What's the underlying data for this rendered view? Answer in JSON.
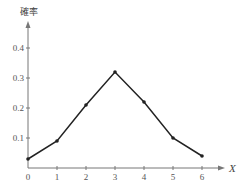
{
  "chart_data": {
    "type": "line",
    "title": "",
    "xlabel": "X",
    "ylabel": "確率",
    "x": [
      0,
      1,
      2,
      3,
      4,
      5,
      6
    ],
    "values": [
      0.03,
      0.09,
      0.21,
      0.32,
      0.22,
      0.1,
      0.04
    ],
    "x_ticks": [
      "0",
      "1",
      "2",
      "3",
      "4",
      "5",
      "6"
    ],
    "y_ticks": [
      "0.1",
      "0.2",
      "0.3",
      "0.4"
    ],
    "ylim": [
      0,
      0.45
    ],
    "xlim": [
      0,
      6.8
    ],
    "grid": false,
    "legend": null,
    "line_color": "#222222",
    "marker": "dot"
  }
}
